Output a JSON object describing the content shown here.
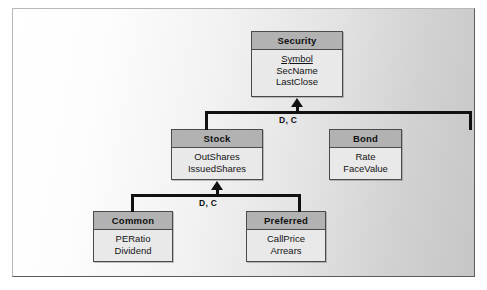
{
  "diagram": {
    "type": "generalization-hierarchy",
    "colors": {
      "entity_header": "#b2b2b2",
      "entity_body": "#e9e9e9",
      "entity_border": "#4a4a4a",
      "connector": "#111111",
      "frame_border": "#b7b7b7",
      "frame_shadow": "#5d5d5d"
    },
    "entities": [
      {
        "id": "security",
        "title": "Security",
        "attributes": [
          {
            "name": "Symbol",
            "key": true
          },
          {
            "name": "SecName",
            "key": false
          },
          {
            "name": "LastClose",
            "key": false
          }
        ]
      },
      {
        "id": "stock",
        "title": "Stock",
        "attributes": [
          {
            "name": "OutShares",
            "key": false
          },
          {
            "name": "IssuedShares",
            "key": false
          }
        ]
      },
      {
        "id": "bond",
        "title": "Bond",
        "attributes": [
          {
            "name": "Rate",
            "key": false
          },
          {
            "name": "FaceValue",
            "key": false
          }
        ]
      },
      {
        "id": "common",
        "title": "Common",
        "attributes": [
          {
            "name": "PERatio",
            "key": false
          },
          {
            "name": "Dividend",
            "key": false
          }
        ]
      },
      {
        "id": "preferred",
        "title": "Preferred",
        "attributes": [
          {
            "name": "CallPrice",
            "key": false
          },
          {
            "name": "Arrears",
            "key": false
          }
        ]
      }
    ],
    "connectors": [
      {
        "id": "upper",
        "parent": "security",
        "children": [
          "stock",
          "bond"
        ],
        "label": "D, C"
      },
      {
        "id": "lower",
        "parent": "stock",
        "children": [
          "common",
          "preferred"
        ],
        "label": "D, C"
      }
    ]
  }
}
